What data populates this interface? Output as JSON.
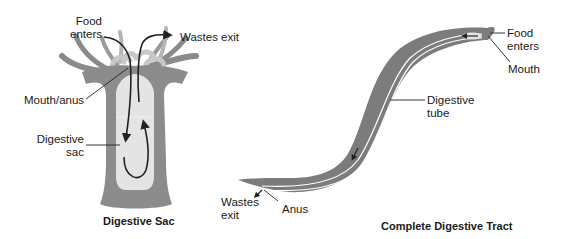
{
  "figures": [
    {
      "id": "digestive-sac",
      "caption": "Digestive Sac",
      "labels": {
        "food_enters_line1": "Food",
        "food_enters_line2": "enters",
        "wastes_exit": "Wastes exit",
        "mouth_anus": "Mouth/anus",
        "digestive_sac_line1": "Digestive",
        "digestive_sac_line2": "sac"
      }
    },
    {
      "id": "complete-digestive-tract",
      "caption": "Complete Digestive Tract",
      "labels": {
        "food_enters_line1": "Food",
        "food_enters_line2": "enters",
        "mouth": "Mouth",
        "digestive_tube_line1": "Digestive",
        "digestive_tube_line2": "tube",
        "wastes_exit_line1": "Wastes",
        "wastes_exit_line2": "exit",
        "anus": "Anus"
      }
    }
  ],
  "colors": {
    "body_dark": "#7a7a7a",
    "body_mid": "#9a9a9a",
    "cavity_light": "#e6e6e6",
    "tentacle_light": "#c4c4c4",
    "arrow": "#222222",
    "tube_line": "#ffffff"
  }
}
